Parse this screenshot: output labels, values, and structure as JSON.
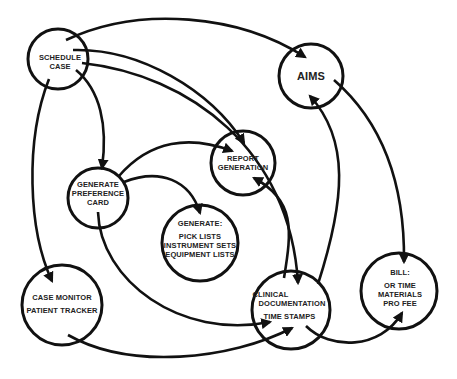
{
  "diagram": {
    "type": "flow",
    "colors": {
      "stroke": "#111111",
      "text": "#222222",
      "background": "#ffffff"
    },
    "nodes": [
      {
        "id": "schedule",
        "lines": [
          "SCHEDULE",
          "CASE"
        ]
      },
      {
        "id": "aims",
        "lines": [
          "AIMS"
        ]
      },
      {
        "id": "report",
        "lines": [
          "REPORT",
          "GENERATION"
        ]
      },
      {
        "id": "pref",
        "lines": [
          "GENERATE",
          "PREFERENCE",
          "CARD"
        ]
      },
      {
        "id": "picklists",
        "title": "GENERATE:",
        "lines": [
          "PICK LISTS",
          "INSTRUMENT SETS",
          "EQUIPMENT LISTS"
        ]
      },
      {
        "id": "monitor",
        "lines": [
          "CASE MONITOR",
          "PATIENT TRACKER"
        ]
      },
      {
        "id": "clinical",
        "lines": [
          "CLINICAL",
          "DOCUMENTATION",
          "TIME STAMPS"
        ]
      },
      {
        "id": "bill",
        "title": "BILL:",
        "lines": [
          "OR TIME",
          "MATERIALS",
          "PRO FEE"
        ]
      }
    ],
    "edges": [
      {
        "from": "schedule",
        "to": "aims"
      },
      {
        "from": "schedule",
        "to": "report"
      },
      {
        "from": "schedule",
        "to": "clinical"
      },
      {
        "from": "schedule",
        "to": "pref"
      },
      {
        "from": "schedule",
        "to": "monitor"
      },
      {
        "from": "pref",
        "to": "report"
      },
      {
        "from": "pref",
        "to": "picklists"
      },
      {
        "from": "pref",
        "to": "clinical"
      },
      {
        "from": "clinical",
        "to": "report"
      },
      {
        "from": "clinical",
        "to": "aims"
      },
      {
        "from": "aims",
        "to": "bill"
      },
      {
        "from": "clinical",
        "to": "bill"
      },
      {
        "from": "monitor",
        "to": "clinical"
      }
    ]
  }
}
